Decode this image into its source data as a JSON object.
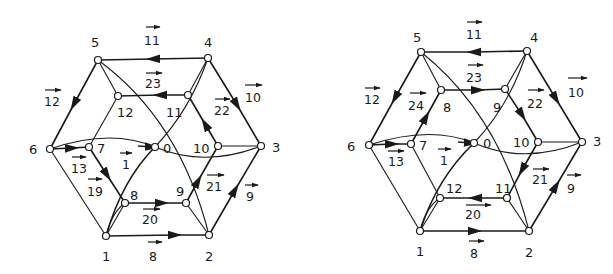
{
  "figure": {
    "diagrams": [
      {
        "id": "left",
        "node_labels": {
          "n0": "0",
          "n1": "1",
          "n2": "2",
          "n3": "3",
          "n4": "4",
          "n5": "5",
          "n6": "6",
          "n7": "7",
          "n8": "8",
          "n9": "9",
          "n10": "10",
          "n11": "11",
          "n12": "12"
        },
        "edge_labels": {
          "e1": "1",
          "e8": "8",
          "e9": "9",
          "e10": "10",
          "e11": "11",
          "e12": "12",
          "e13": "13",
          "e19": "19",
          "e20": "20",
          "e21": "21",
          "e22": "22",
          "e23": "23"
        }
      },
      {
        "id": "right",
        "node_labels": {
          "n0": "0",
          "n1": "1",
          "n2": "2",
          "n3": "3",
          "n4": "4",
          "n5": "5",
          "n6": "6",
          "n7": "7",
          "n8": "8",
          "n9": "9",
          "n10": "10",
          "n11": "11",
          "n12": "12"
        },
        "edge_labels": {
          "e1": "1",
          "e8": "8",
          "e9": "9",
          "e10": "10",
          "e11": "11",
          "e12": "12",
          "e13": "13",
          "e20": "20",
          "e21": "21",
          "e22": "22",
          "e23": "23",
          "e24": "24"
        }
      }
    ],
    "colors": {
      "ink": "#1a1a1a",
      "background": "#ffffff"
    }
  }
}
